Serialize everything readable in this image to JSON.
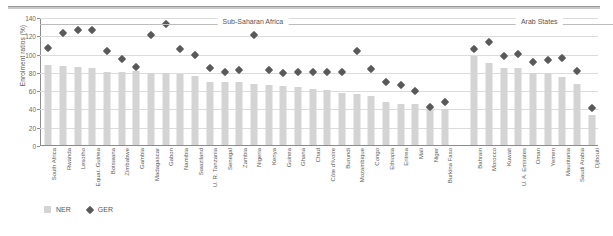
{
  "figure": {
    "ylabel": "Enrolment ratios (%)",
    "legend": [
      {
        "name": "ner-swatch",
        "label": "NER",
        "color": "#d4d4d4",
        "shape": "square"
      },
      {
        "name": "ger-swatch",
        "label": "GER",
        "color": "#595959",
        "shape": "diamond"
      }
    ],
    "regions": [
      {
        "label": "Sub-Saharan Africa",
        "start": 0,
        "end": 28
      },
      {
        "label": "Arab States",
        "start": 29,
        "end": 38
      }
    ]
  },
  "chart_data": {
    "type": "bar",
    "title": "",
    "xlabel": "",
    "ylabel": "Enrolment ratios (%)",
    "ylim": [
      0,
      140
    ],
    "yticks": [
      0,
      20,
      40,
      60,
      80,
      100,
      120,
      140
    ],
    "grid": true,
    "legend_position": "bottom-left",
    "categories": [
      "South Africa",
      "Rwanda",
      "Lesotho",
      "Equat. Guinea",
      "Botswana",
      "Zimbabwe",
      "Gambia",
      "Madagascar",
      "Gabon",
      "Namibia",
      "Swaziland",
      "U. R. Tanzania",
      "Senegal",
      "Zambia",
      "Nigeria",
      "Kenya",
      "Guinea",
      "Ghana",
      "Chad",
      "Côte d'Ivoire",
      "Burundi",
      "Mozambique",
      "Congo",
      "Ethiopia",
      "Eritrea",
      "Mali",
      "Niger",
      "Burkina Faso",
      "",
      "Bahrain",
      "Morocco",
      "Kuwait",
      "U. A. Emirates",
      "Oman",
      "Yemen",
      "Mauritania",
      "Saudi Arabia",
      "Djibouti"
    ],
    "series": [
      {
        "name": "NER",
        "color": "#d4d4d4",
        "values": [
          88,
          86,
          85,
          84,
          80,
          80,
          81,
          79,
          79,
          78,
          76,
          69,
          69,
          69,
          67,
          66,
          65,
          63,
          61,
          60,
          57,
          56,
          54,
          47,
          45,
          45,
          42,
          39,
          null,
          97,
          90,
          84,
          84,
          79,
          79,
          74,
          67,
          33
        ]
      },
      {
        "name": "GER",
        "color": "#595959",
        "values": [
          106,
          122,
          126,
          126,
          103,
          94,
          85,
          120,
          132,
          105,
          98,
          84,
          80,
          82,
          120,
          82,
          79,
          80,
          80,
          80,
          80,
          103,
          83,
          69,
          66,
          59,
          42,
          47,
          null,
          105,
          113,
          97,
          100,
          91,
          93,
          95,
          81,
          40
        ]
      }
    ]
  }
}
